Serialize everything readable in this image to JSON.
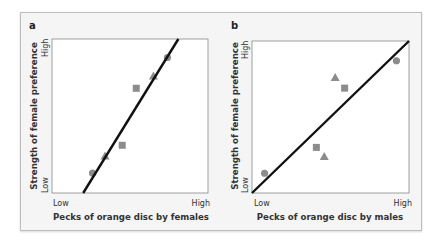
{
  "chart_data": [
    {
      "type": "scatter",
      "panel_label": "a",
      "title": "",
      "xlabel": "Pecks of orange disc by females",
      "ylabel": "Strength of female preference",
      "x_ticks": [
        "Low",
        "High"
      ],
      "y_ticks": [
        "Low",
        "High"
      ],
      "xlim": [
        0,
        1
      ],
      "ylim": [
        0,
        1
      ],
      "grid": false,
      "legend": "none",
      "marker_color": "#8c8c8c",
      "line_color": "#111111",
      "points": [
        {
          "shape": "circle",
          "x": 0.26,
          "y": 0.13
        },
        {
          "shape": "triangle",
          "x": 0.34,
          "y": 0.24
        },
        {
          "shape": "square",
          "x": 0.45,
          "y": 0.31
        },
        {
          "shape": "square",
          "x": 0.54,
          "y": 0.68
        },
        {
          "shape": "triangle",
          "x": 0.65,
          "y": 0.76
        },
        {
          "shape": "circle",
          "x": 0.74,
          "y": 0.88
        }
      ],
      "fit_line": {
        "x0": 0.2,
        "y0": 0.0,
        "x1": 0.81,
        "y1": 1.0
      }
    },
    {
      "type": "scatter",
      "panel_label": "b",
      "title": "",
      "xlabel": "Pecks of orange disc by males",
      "ylabel": "Strength of female preference",
      "x_ticks": [
        "Low",
        "High"
      ],
      "y_ticks": [
        "Low",
        "High"
      ],
      "xlim": [
        0,
        1
      ],
      "ylim": [
        0,
        1
      ],
      "grid": false,
      "legend": "none",
      "marker_color": "#8c8c8c",
      "line_color": "#111111",
      "points": [
        {
          "shape": "circle",
          "x": 0.08,
          "y": 0.13
        },
        {
          "shape": "square",
          "x": 0.41,
          "y": 0.3
        },
        {
          "shape": "triangle",
          "x": 0.46,
          "y": 0.24
        },
        {
          "shape": "triangle",
          "x": 0.53,
          "y": 0.76
        },
        {
          "shape": "square",
          "x": 0.59,
          "y": 0.69
        },
        {
          "shape": "circle",
          "x": 0.92,
          "y": 0.87
        }
      ],
      "fit_line": {
        "x0": 0.0,
        "y0": 0.0,
        "x1": 1.0,
        "y1": 1.0
      }
    }
  ]
}
